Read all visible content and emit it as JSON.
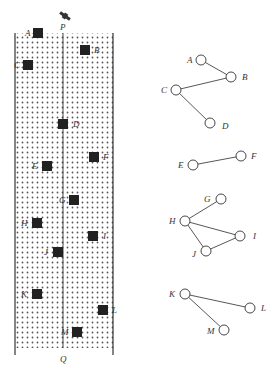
{
  "colors": {
    "ink": "#333333",
    "building": "#222222",
    "dots": "#555555",
    "background": "#ffffff"
  },
  "map": {
    "top_label": "P",
    "bottom_label": "Q",
    "icon": "satellite-icon",
    "buildings": [
      {
        "id": "A",
        "label": "A",
        "x": 38,
        "y": 33,
        "lx": 25,
        "ly": 36
      },
      {
        "id": "B",
        "label": "B",
        "x": 85,
        "y": 50,
        "lx": 94,
        "ly": 53
      },
      {
        "id": "C",
        "label": "C",
        "x": 28,
        "y": 65,
        "lx": 14,
        "ly": 68
      },
      {
        "id": "D",
        "label": "D",
        "x": 63,
        "y": 124,
        "lx": 73,
        "ly": 127
      },
      {
        "id": "E",
        "label": "E",
        "x": 47,
        "y": 166,
        "lx": 32,
        "ly": 169
      },
      {
        "id": "F",
        "label": "F",
        "x": 94,
        "y": 157,
        "lx": 103,
        "ly": 160
      },
      {
        "id": "G",
        "label": "G",
        "x": 74,
        "y": 200,
        "lx": 59,
        "ly": 203
      },
      {
        "id": "H",
        "label": "H",
        "x": 37,
        "y": 223,
        "lx": 21,
        "ly": 226
      },
      {
        "id": "I",
        "label": "I",
        "x": 93,
        "y": 236,
        "lx": 103,
        "ly": 239
      },
      {
        "id": "J",
        "label": "J",
        "x": 58,
        "y": 252,
        "lx": 44,
        "ly": 255
      },
      {
        "id": "K",
        "label": "K",
        "x": 37,
        "y": 294,
        "lx": 21,
        "ly": 297
      },
      {
        "id": "L",
        "label": "L",
        "x": 103,
        "y": 310,
        "lx": 112,
        "ly": 313
      },
      {
        "id": "M",
        "label": "M",
        "x": 77,
        "y": 332,
        "lx": 61,
        "ly": 335
      }
    ]
  },
  "graph": {
    "nodes": [
      {
        "id": "A",
        "label": "A",
        "x": 201,
        "y": 60,
        "lx": 187,
        "ly": 63
      },
      {
        "id": "B",
        "label": "B",
        "x": 231,
        "y": 77,
        "lx": 242,
        "ly": 80
      },
      {
        "id": "C",
        "label": "C",
        "x": 176,
        "y": 90,
        "lx": 161,
        "ly": 93
      },
      {
        "id": "D",
        "label": "D",
        "x": 210,
        "y": 123,
        "lx": 222,
        "ly": 129
      },
      {
        "id": "E",
        "label": "E",
        "x": 193,
        "y": 165,
        "lx": 178,
        "ly": 168
      },
      {
        "id": "F",
        "label": "F",
        "x": 241,
        "y": 156,
        "lx": 251,
        "ly": 159
      },
      {
        "id": "G",
        "label": "G",
        "x": 221,
        "y": 199,
        "lx": 204,
        "ly": 202
      },
      {
        "id": "H",
        "label": "H",
        "x": 185,
        "y": 221,
        "lx": 169,
        "ly": 224
      },
      {
        "id": "I",
        "label": "I",
        "x": 240,
        "y": 236,
        "lx": 253,
        "ly": 239
      },
      {
        "id": "J",
        "label": "J",
        "x": 206,
        "y": 251,
        "lx": 192,
        "ly": 257
      },
      {
        "id": "K",
        "label": "K",
        "x": 185,
        "y": 294,
        "lx": 169,
        "ly": 297
      },
      {
        "id": "L",
        "label": "L",
        "x": 250,
        "y": 308,
        "lx": 261,
        "ly": 311
      },
      {
        "id": "M",
        "label": "M",
        "x": 224,
        "y": 330,
        "lx": 207,
        "ly": 334
      }
    ],
    "edges": [
      [
        "A",
        "B"
      ],
      [
        "B",
        "C"
      ],
      [
        "C",
        "D"
      ],
      [
        "E",
        "F"
      ],
      [
        "G",
        "H"
      ],
      [
        "H",
        "I"
      ],
      [
        "H",
        "J"
      ],
      [
        "J",
        "I"
      ],
      [
        "K",
        "L"
      ],
      [
        "K",
        "M"
      ]
    ]
  }
}
